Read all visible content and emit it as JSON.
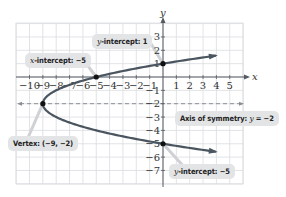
{
  "chart_data": {
    "type": "line",
    "title": "",
    "equation": "x = y^2 + 4y - 5",
    "xlabel": "x",
    "ylabel": "y",
    "xlim": [
      -11,
      6
    ],
    "ylim": [
      -8,
      4
    ],
    "grid": true,
    "x_ticks": [
      -10,
      -9,
      -8,
      -7,
      -6,
      -5,
      -4,
      -3,
      -2,
      -1,
      1,
      2,
      3,
      4,
      5
    ],
    "y_ticks": [
      3,
      2,
      1,
      -1,
      -2,
      -3,
      -4,
      -5,
      -6,
      -7
    ],
    "series": [
      {
        "name": "parabola",
        "color": "#4a5560",
        "points": [
          [
            3.96,
            1.6
          ],
          [
            0,
            1
          ],
          [
            -5,
            0
          ],
          [
            -8,
            -1
          ],
          [
            -9,
            -2
          ],
          [
            -8,
            -3
          ],
          [
            -5,
            -4
          ],
          [
            0,
            -5
          ],
          [
            3.96,
            -5.6
          ]
        ]
      }
    ],
    "axis_of_symmetry": {
      "y": -2,
      "style": "dashed",
      "color": "#8a8f96"
    },
    "key_points": [
      {
        "name": "y-intercept top",
        "x": 0,
        "y": 1
      },
      {
        "name": "x-intercept",
        "x": -5,
        "y": 0
      },
      {
        "name": "vertex",
        "x": -9,
        "y": -2
      },
      {
        "name": "y-intercept bottom",
        "x": 0,
        "y": -5
      }
    ],
    "annotations": [
      {
        "id": "y_int_top",
        "prefix_var": "y",
        "text": "-intercept: 1"
      },
      {
        "id": "x_int",
        "prefix_var": "x",
        "text": "-intercept: −5"
      },
      {
        "id": "vertex",
        "text": "Vertex: (−9, −2)"
      },
      {
        "id": "axis",
        "text": "Axis of symmetry: ",
        "var": "y",
        "suffix": " = −2"
      },
      {
        "id": "y_int_bottom",
        "prefix_var": "y",
        "text": "-intercept: −5"
      }
    ]
  },
  "labels": {
    "x_axis": "x",
    "y_axis": "y",
    "y_int_top_var": "y",
    "y_int_top_text": "-intercept: 1",
    "x_int_var": "x",
    "x_int_text": "-intercept: −5",
    "vertex_text": "Vertex: (−9, −2)",
    "axis_text": "Axis of symmetry: ",
    "axis_var": "y",
    "axis_suffix": " = −2",
    "y_int_bottom_var": "y",
    "y_int_bottom_text": "-intercept: −5"
  },
  "colors": {
    "curve": "#4a5560",
    "axis": "#555a60",
    "grid": "#d9dcdf",
    "callout_bg": "#e3e4e6",
    "dashed": "#8a8f96"
  }
}
